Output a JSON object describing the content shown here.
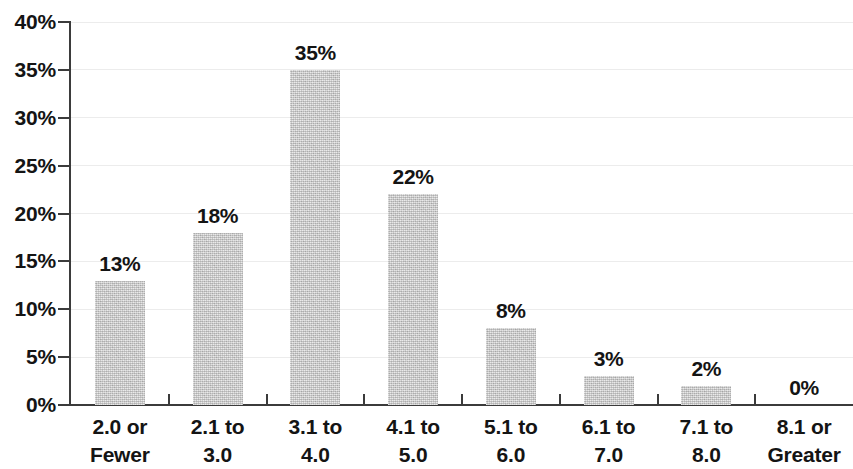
{
  "chart_data": {
    "type": "bar",
    "title": "",
    "subtitle": "",
    "xlabel": "",
    "ylabel": "",
    "categories": [
      "2.0 or Fewer",
      "2.1 to 3.0",
      "3.1 to 4.0",
      "4.1 to 5.0",
      "5.1 to 6.0",
      "6.1 to 7.0",
      "7.1 to 8.0",
      "8.1 or Greater"
    ],
    "category_lines": [
      [
        "2.0 or",
        "Fewer"
      ],
      [
        "2.1 to",
        "3.0"
      ],
      [
        "3.1 to",
        "4.0"
      ],
      [
        "4.1 to",
        "5.0"
      ],
      [
        "5.1 to",
        "6.0"
      ],
      [
        "6.1 to",
        "7.0"
      ],
      [
        "7.1 to",
        "8.0"
      ],
      [
        "8.1 or",
        "Greater"
      ]
    ],
    "values": [
      13,
      18,
      35,
      22,
      8,
      3,
      2,
      0
    ],
    "value_labels": [
      "13%",
      "18%",
      "35%",
      "22%",
      "8%",
      "3%",
      "2%",
      "0%"
    ],
    "ylim": [
      0,
      40
    ],
    "ytick_values": [
      0,
      5,
      10,
      15,
      20,
      25,
      30,
      35,
      40
    ],
    "ytick_labels": [
      "0%",
      "5%",
      "10%",
      "15%",
      "20%",
      "25%",
      "30%",
      "35%",
      "40%"
    ],
    "grid": true,
    "legend": false,
    "legend_position": "none",
    "bar_color": "#c4c4c4",
    "axis_color": "#3b3b3b",
    "text_color": "#141414",
    "grid_color": "#ececec"
  }
}
